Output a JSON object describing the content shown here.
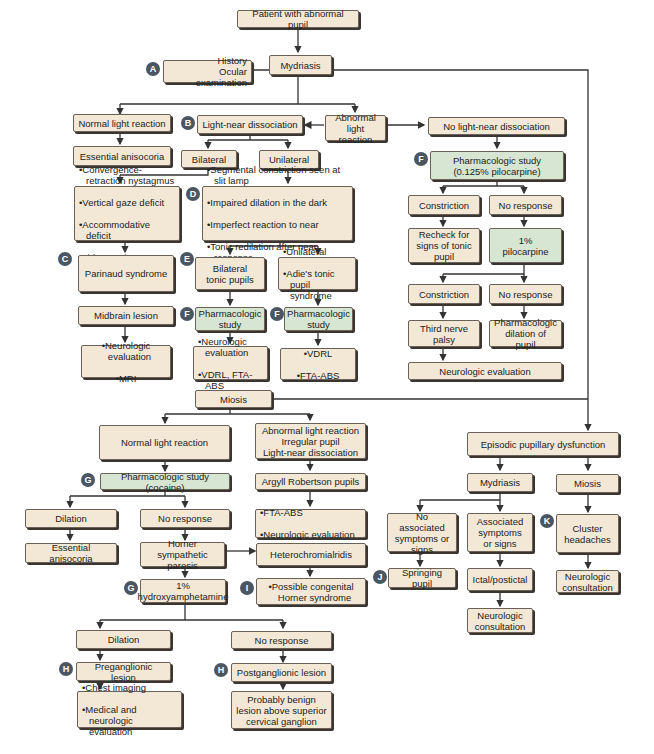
{
  "diagram": {
    "colors": {
      "box_fill": "#f3e8d6",
      "green_fill": "#d6e6d2",
      "badge": "#4b5662",
      "line": "#3a3a3a"
    },
    "badges": {
      "A": "A",
      "B": "B",
      "C": "C",
      "D": "D",
      "E": "E",
      "F": "F",
      "G": "G",
      "H": "H",
      "I": "I",
      "J": "J",
      "K": "K"
    },
    "nodes": {
      "patient": "Patient with abnormal pupil",
      "history": "History\nOcular examination",
      "mydriasis": "Mydriasis",
      "normal_light": "Normal light reaction",
      "essential_aniso_1": "Essential anisocoria",
      "light_near": "Light-near dissociation",
      "abnormal_light": "Abnormal\nlight reaction",
      "no_light_near": "No light-near dissociation",
      "bilateral": "Bilateral",
      "unilateral": "Unilateral",
      "parinaud_signs": [
        "Convergence-retraction nystagmus",
        "Vertical gaze deficit",
        "Accommodative deficit",
        "Lid retraction"
      ],
      "tonic_signs": [
        "Segmental constriction seen at slit lamp",
        "Impaired dilation in the dark",
        "Imperfect reaction to near",
        "Tonic redilation after near response"
      ],
      "parinaud": "Parinaud syndrome",
      "midbrain": "Midbrain lesion",
      "midbrain_eval": [
        "Neurologic evaluation",
        "MRI"
      ],
      "bilateral_tonic": "Bilateral\ntonic pupils",
      "adie": [
        "Unilateral",
        "Adie's tonic pupil syndrome"
      ],
      "pharm_study_1": "Pharmacologic\nstudy",
      "pharm_study_2": "Pharmacologic\nstudy",
      "bilateral_eval": [
        "Neurologic evaluation",
        "VDRL, FTA-ABS"
      ],
      "adie_eval": [
        "VDRL",
        "FTA-ABS"
      ],
      "pilo_study": "Pharmacologic study\n(0.125% pilocarpine)",
      "constriction_1": "Constriction",
      "no_response_1": "No response",
      "recheck": "Recheck for\nsigns of tonic\npupil",
      "pilo_1pct": "1%\npilocarpine",
      "constriction_2": "Constriction",
      "no_response_2": "No response",
      "third_nerve": "Third nerve\npalsy",
      "pharm_dilation": "Pharmacologic\ndilation of pupil",
      "neuro_eval": "Neurologic evaluation",
      "miosis": "Miosis",
      "miosis_normal": "Normal light reaction",
      "miosis_abnormal": "Abnormal light reaction\nIrregular pupil\nLight-near dissociation",
      "cocaine": "Pharmacologic study (cocaine)",
      "argyll": "Argyll Robertson pupils",
      "argyll_eval": [
        "FTA-ABS",
        "Neurologic evaluation"
      ],
      "dilation_1": "Dilation",
      "no_response_3": "No response",
      "essential_aniso_2": "Essential anisocoria",
      "horner": "Horner sympathetic\nparesis",
      "heterochromia": "Heterochromialridis",
      "hydroxy": "1%\nhydroxyamphetamine",
      "congenital": [
        "Possible congenital Horner syndrome"
      ],
      "dilation_2": "Dilation",
      "no_response_4": "No response",
      "preganglionic": "Preganglionic lesion",
      "postganglionic": "Postganglionic lesion",
      "pre_eval": [
        "Chest imaging",
        "Medical and neurologic evaluation"
      ],
      "post_eval": "Probably benign\nlesion above superior\ncervical ganglion",
      "episodic": "Episodic pupillary dysfunction",
      "ep_mydriasis": "Mydriasis",
      "ep_miosis": "Miosis",
      "no_assoc": "No associated\nsymptoms or\nsigns",
      "assoc": "Associated\nsymptoms\nor signs",
      "cluster": "Cluster\nheadaches",
      "springing": "Springing pupil",
      "ictal": "Ictal/postictal",
      "neuro_consult_1": "Neurologic\nconsultation",
      "neuro_consult_2": "Neurologic\nconsultation"
    }
  }
}
